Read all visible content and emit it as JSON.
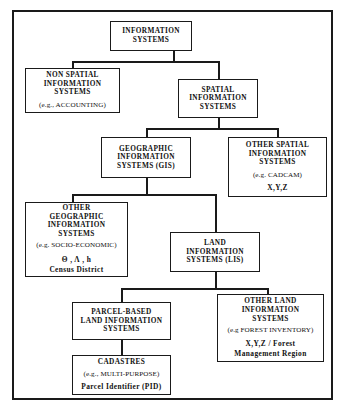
{
  "diagram": {
    "type": "tree",
    "frame_color": "#1a1a1a",
    "background": "#ffffff",
    "nodes": [
      {
        "id": "information-systems",
        "level": 0,
        "title_lines": [
          "INFORMATION",
          "SYSTEMS"
        ],
        "examples": [],
        "attributes": []
      },
      {
        "id": "non-spatial-information-systems",
        "level": 1,
        "title_lines": [
          "NON  SPATIAL",
          "INFORMATION",
          "SYSTEMS"
        ],
        "examples": [
          "(e.g., ACCOUNTING)"
        ],
        "attributes": []
      },
      {
        "id": "spatial-information-systems",
        "level": 1,
        "title_lines": [
          "SPATIAL",
          "INFORMATION",
          "SYSTEMS"
        ],
        "examples": [],
        "attributes": []
      },
      {
        "id": "geographic-information-systems",
        "level": 2,
        "title_lines": [
          "GEOGRAPHIC",
          "INFORMATION",
          "SYSTEMS  (GIS)"
        ],
        "examples": [],
        "attributes": []
      },
      {
        "id": "other-spatial-information-systems",
        "level": 2,
        "title_lines": [
          "OTHER SPATIAL",
          "INFORMATION",
          "SYSTEMS"
        ],
        "examples": [
          "(e.g. CADCAM)"
        ],
        "attributes": [
          "X,Y,Z"
        ]
      },
      {
        "id": "other-geographic-information-systems",
        "level": 3,
        "title_lines": [
          "OTHER",
          "GEOGRAPHIC",
          "INFORMATION",
          "SYSTEMS"
        ],
        "examples": [
          "(e.g. SOCIO-ECONOMIC)"
        ],
        "attributes": [
          "Θ , Λ , h",
          "Census  District"
        ]
      },
      {
        "id": "land-information-systems",
        "level": 3,
        "title_lines": [
          "LAND",
          "INFORMATION",
          "SYSTEMS  (LIS)"
        ],
        "examples": [],
        "attributes": []
      },
      {
        "id": "parcel-based-land-information-systems",
        "level": 4,
        "title_lines": [
          "PARCEL-BASED",
          "LAND  INFORMATION",
          "SYSTEMS"
        ],
        "examples": [],
        "attributes": []
      },
      {
        "id": "other-land-information-systems",
        "level": 4,
        "title_lines": [
          "OTHER LAND",
          "INFORMATION",
          "SYSTEMS"
        ],
        "examples": [
          "(e.g FOREST INVENTORY)"
        ],
        "attributes": [
          "X,Y,Z  /  Forest",
          "Management  Region"
        ]
      },
      {
        "id": "cadastres",
        "level": 5,
        "title_lines": [
          "CADASTRES"
        ],
        "examples": [
          "(e.g., MULTI-PURPOSE)"
        ],
        "attributes": [
          "Parcel  Identifier  (PID)"
        ]
      }
    ],
    "edges": [
      {
        "from": "information-systems",
        "to": "non-spatial-information-systems"
      },
      {
        "from": "information-systems",
        "to": "spatial-information-systems"
      },
      {
        "from": "spatial-information-systems",
        "to": "geographic-information-systems"
      },
      {
        "from": "spatial-information-systems",
        "to": "other-spatial-information-systems"
      },
      {
        "from": "geographic-information-systems",
        "to": "other-geographic-information-systems"
      },
      {
        "from": "geographic-information-systems",
        "to": "land-information-systems"
      },
      {
        "from": "land-information-systems",
        "to": "parcel-based-land-information-systems"
      },
      {
        "from": "land-information-systems",
        "to": "other-land-information-systems"
      },
      {
        "from": "parcel-based-land-information-systems",
        "to": "cadastres"
      }
    ]
  }
}
